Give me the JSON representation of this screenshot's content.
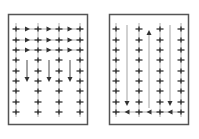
{
  "diagram": {
    "colors": {
      "border": "#555555",
      "line": "#999999",
      "marker": "#222222",
      "arrow": "#333333"
    },
    "panels": [
      {
        "id": "left",
        "box": {
          "x": 8.5,
          "y": 14.5,
          "w": 79,
          "h": 110
        },
        "columns_x": [
          16,
          38,
          59,
          80
        ],
        "rows_y": [
          29,
          40,
          50,
          60,
          71,
          81,
          91,
          102,
          112
        ],
        "pattern": "horizontal-rows-then-vertical",
        "horizontal_arrow_rows": [
          29,
          40,
          50
        ],
        "down_arrows_x": [
          27,
          49,
          70
        ],
        "down_arrow_range": [
          60,
          82
        ]
      },
      {
        "id": "right",
        "box": {
          "x": 109.5,
          "y": 14.5,
          "w": 79,
          "h": 110
        },
        "columns_x": [
          116,
          139,
          160,
          181
        ],
        "rows_y": [
          29,
          40,
          50,
          60,
          71,
          81,
          91,
          102,
          112
        ],
        "pattern": "serpentine-vertical",
        "vertical_lines": [
          {
            "x": 127,
            "from": 25,
            "to": 106,
            "dir": "down"
          },
          {
            "x": 149,
            "from": 108,
            "to": 30,
            "dir": "up"
          },
          {
            "x": 170,
            "from": 25,
            "to": 106,
            "dir": "down"
          }
        ],
        "bottom_left_arrows_y": 112
      }
    ]
  }
}
